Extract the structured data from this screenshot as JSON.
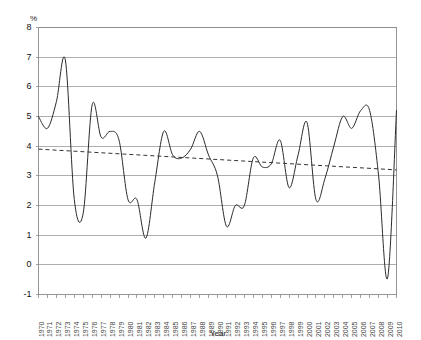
{
  "chart_data": {
    "type": "line",
    "title": "",
    "subtitle": "",
    "xlabel": "Year",
    "ylabel": "%",
    "ylim": [
      -1,
      8
    ],
    "xlim": [
      1970,
      2010
    ],
    "yticks": [
      8,
      7,
      6,
      5,
      4,
      3,
      2,
      1,
      0,
      -1
    ],
    "ytick_labels": [
      "8",
      "7",
      "6",
      "5",
      "4",
      "3",
      "2",
      "1",
      "0",
      "-1"
    ],
    "grid": true,
    "grid_axis": "y",
    "legend": false,
    "legend_position": "none",
    "categories": [
      "1970",
      "1971",
      "1972",
      "1973",
      "1974",
      "1975",
      "1976",
      "1977",
      "1978",
      "1979",
      "1980",
      "1981",
      "1982",
      "1983",
      "1984",
      "1985",
      "1986",
      "1987",
      "1988",
      "1989",
      "1990",
      "1991",
      "1992",
      "1993",
      "1994",
      "1995",
      "1996",
      "1997",
      "1998",
      "1999",
      "2000",
      "2001",
      "2002",
      "2003",
      "2004",
      "2005",
      "2006",
      "2007",
      "2008",
      "2009",
      "2010"
    ],
    "x": [
      1970,
      1971,
      1972,
      1973,
      1974,
      1975,
      1976,
      1977,
      1978,
      1979,
      1980,
      1981,
      1982,
      1983,
      1984,
      1985,
      1986,
      1987,
      1988,
      1989,
      1990,
      1991,
      1992,
      1993,
      1994,
      1995,
      1996,
      1997,
      1998,
      1999,
      2000,
      2001,
      2002,
      2003,
      2004,
      2005,
      2006,
      2007,
      2008,
      2009,
      2010
    ],
    "series": [
      {
        "name": "Growth rate",
        "style": "solid",
        "color": "#2b2b2b",
        "values": [
          5.0,
          4.6,
          5.5,
          6.9,
          2.2,
          1.75,
          5.4,
          4.3,
          4.5,
          4.2,
          2.2,
          2.2,
          0.9,
          2.8,
          4.5,
          3.7,
          3.6,
          3.9,
          4.5,
          3.7,
          3.0,
          1.3,
          2.0,
          2.0,
          3.6,
          3.3,
          3.4,
          4.2,
          2.6,
          3.7,
          4.8,
          2.2,
          2.9,
          4.0,
          5.0,
          4.6,
          5.2,
          5.2,
          3.0,
          -0.45,
          5.2
        ]
      },
      {
        "name": "Trend",
        "style": "dashed",
        "color": "#333333",
        "values": [
          3.9,
          3.88,
          3.87,
          3.85,
          3.84,
          3.82,
          3.81,
          3.79,
          3.78,
          3.76,
          3.74,
          3.73,
          3.71,
          3.7,
          3.68,
          3.67,
          3.65,
          3.63,
          3.62,
          3.6,
          3.59,
          3.57,
          3.56,
          3.54,
          3.53,
          3.51,
          3.49,
          3.48,
          3.46,
          3.45,
          3.43,
          3.42,
          3.4,
          3.38,
          3.37,
          3.35,
          3.34,
          3.32,
          3.31,
          3.29,
          3.2
        ]
      }
    ]
  }
}
